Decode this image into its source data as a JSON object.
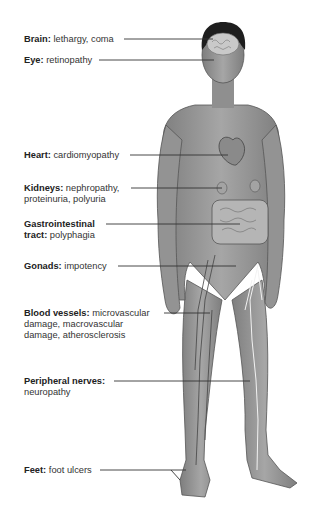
{
  "figure": {
    "colors": {
      "skin": "#9a9a9a",
      "skin_shadow": "#7d7d7d",
      "hair": "#1e1e1e",
      "leader_line": "#333333",
      "nerve": "#f2f2f2",
      "vessel": "#4a4a4a"
    }
  },
  "labels": [
    {
      "term": "Brain:",
      "desc": "lethargy, coma"
    },
    {
      "term": "Eye:",
      "desc": "retinopathy"
    },
    {
      "term": "Heart:",
      "desc": "cardiomyopathy"
    },
    {
      "term": "Kidneys:",
      "desc": "nephropathy,",
      "desc2": "proteinuria, polyuria"
    },
    {
      "term": "Gastrointestinal",
      "term2": "tract:",
      "desc2": "polyphagia"
    },
    {
      "term": "Gonads:",
      "desc": "impotency"
    },
    {
      "term": "Blood vessels:",
      "desc": "microvascular",
      "desc2": "damage, macrovascular",
      "desc3": "damage, atherosclerosis"
    },
    {
      "term": "Peripheral nerves:",
      "desc2": "neuropathy"
    },
    {
      "term": "Feet:",
      "desc": "foot ulcers"
    }
  ]
}
